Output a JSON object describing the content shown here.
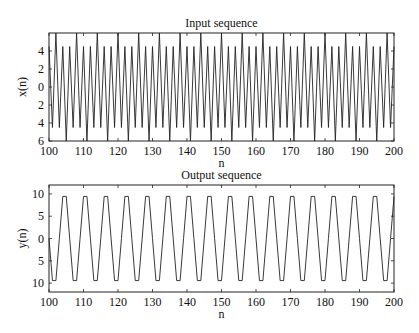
{
  "chart_data": [
    {
      "type": "line",
      "title": "Input sequence",
      "xlabel": "n",
      "ylabel": "x(n)",
      "xlim": [
        100,
        200
      ],
      "ylim": [
        -6,
        6
      ],
      "xticks": [
        100,
        110,
        120,
        130,
        140,
        150,
        160,
        170,
        180,
        190,
        200
      ],
      "yticks": [
        4,
        2,
        0,
        -2,
        -4,
        -6
      ],
      "ytick_labels": [
        "4",
        "2",
        "0",
        "2",
        "4",
        "6"
      ],
      "model": "x(n) = 5cos(pi n) + cos(pi n / 3)",
      "grid": false
    },
    {
      "type": "line",
      "title": "Output sequence",
      "xlabel": "n",
      "ylabel": "y(n)",
      "xlim": [
        100,
        200
      ],
      "ylim": [
        -12,
        12
      ],
      "xticks": [
        100,
        110,
        120,
        130,
        140,
        150,
        160,
        170,
        180,
        190,
        200
      ],
      "yticks": [
        10,
        5,
        0,
        -5,
        -10
      ],
      "ytick_labels": [
        "10",
        "5",
        "0",
        "5",
        "10"
      ],
      "model": "y(n) = 10.9cos(pi (n - 104.5) / 3)",
      "grid": false
    }
  ],
  "plots": {
    "top": {
      "title": "Input sequence",
      "xlabel": "n",
      "ylabel": "x(n)"
    },
    "bottom": {
      "title": "Output sequence",
      "xlabel": "n",
      "ylabel": "y(n)"
    }
  }
}
